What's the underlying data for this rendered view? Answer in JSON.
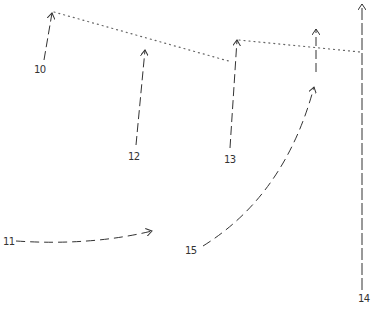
{
  "diagram": {
    "title": "",
    "colors": {
      "stroke": "#333333",
      "dotted": "#666666",
      "background": "#ffffff"
    },
    "arrows": [
      {
        "id": "10",
        "label": "10",
        "style": "dashed",
        "path": "M44,60 L52,13"
      },
      {
        "id": "11",
        "label": "11",
        "style": "dashed",
        "path": "M16,241 Q90,246 152,231"
      },
      {
        "id": "12",
        "label": "12",
        "style": "dashed",
        "path": "M136,145 L145,50"
      },
      {
        "id": "13",
        "label": "13",
        "style": "dashed",
        "path": "M230,148 L237,40"
      },
      {
        "id": "14",
        "label": "14",
        "style": "dashed",
        "path": "M362,290 L362,4"
      },
      {
        "id": "15",
        "label": "15",
        "style": "dashed",
        "path": "M203,246 Q285,195 314,87"
      },
      {
        "id": "16",
        "label": "",
        "style": "dashed",
        "path": "M316,72 L316,29"
      }
    ],
    "dotted_connectors": [
      {
        "from": "10",
        "path": "M54,12 L232,62"
      },
      {
        "from": "13",
        "path": "M239,40 L360,52"
      }
    ],
    "labels": [
      {
        "text": "10",
        "x": 34,
        "y": 73
      },
      {
        "text": "11",
        "x": 3,
        "y": 245
      },
      {
        "text": "12",
        "x": 128,
        "y": 160
      },
      {
        "text": "13",
        "x": 224,
        "y": 163
      },
      {
        "text": "14",
        "x": 358,
        "y": 302
      },
      {
        "text": "15",
        "x": 185,
        "y": 254
      }
    ]
  }
}
